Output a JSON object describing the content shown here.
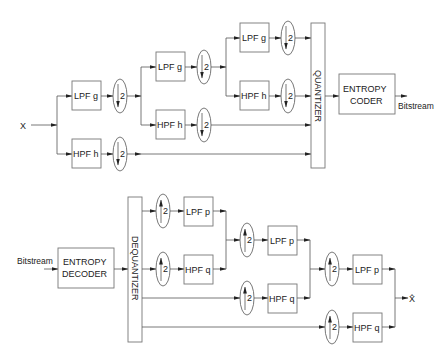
{
  "diagram": {
    "encoder": {
      "input_label": "X",
      "filters": [
        {
          "id": "enc-l1-lpf",
          "label": "LPF g",
          "x": 72,
          "y": 81
        },
        {
          "id": "enc-l1-hpf",
          "label": "HPF h",
          "x": 72,
          "y": 139
        },
        {
          "id": "enc-l2-lpf",
          "label": "LPF g",
          "x": 156,
          "y": 52
        },
        {
          "id": "enc-l2-hpf",
          "label": "HPF h",
          "x": 156,
          "y": 110
        },
        {
          "id": "enc-l3-lpf",
          "label": "LPF g",
          "x": 240,
          "y": 23
        },
        {
          "id": "enc-l3-hpf",
          "label": "HPF h",
          "x": 240,
          "y": 81
        }
      ],
      "downsamplers": [
        {
          "label": "2",
          "cx": 120,
          "cy": 96
        },
        {
          "label": "2",
          "cx": 120,
          "cy": 154
        },
        {
          "label": "2",
          "cx": 204,
          "cy": 67
        },
        {
          "label": "2",
          "cx": 204,
          "cy": 125
        },
        {
          "label": "2",
          "cx": 288,
          "cy": 38
        },
        {
          "label": "2",
          "cx": 288,
          "cy": 96
        }
      ],
      "quantizer_label": "QUANTIZER",
      "entropy_coder_label": [
        "ENTROPY",
        "CODER"
      ],
      "output_label": "Bitstream"
    },
    "decoder": {
      "input_label": "Bitstream",
      "entropy_decoder_label": [
        "ENTROPY",
        "DECODER"
      ],
      "dequantizer_label": "DEQUANTIZER",
      "filters": [
        {
          "id": "dec-l1-lpf",
          "label": "LPF p",
          "x": 184,
          "y": 197
        },
        {
          "id": "dec-l1-hpf",
          "label": "HPF q",
          "x": 184,
          "y": 255
        },
        {
          "id": "dec-l2-lpf",
          "label": "LPF p",
          "x": 268,
          "y": 226
        },
        {
          "id": "dec-l2-hpf",
          "label": "HPF q",
          "x": 268,
          "y": 284
        },
        {
          "id": "dec-l3-lpf",
          "label": "LPF p",
          "x": 353,
          "y": 255
        },
        {
          "id": "dec-l3-hpf",
          "label": "HPF q",
          "x": 353,
          "y": 313
        }
      ],
      "upsamplers": [
        {
          "label": "2",
          "cx": 163,
          "cy": 211
        },
        {
          "label": "2",
          "cx": 163,
          "cy": 269
        },
        {
          "label": "2",
          "cx": 247,
          "cy": 240
        },
        {
          "label": "2",
          "cx": 247,
          "cy": 298
        },
        {
          "label": "2",
          "cx": 332,
          "cy": 269
        },
        {
          "label": "2",
          "cx": 332,
          "cy": 327
        }
      ],
      "output_label": "X̂"
    }
  }
}
